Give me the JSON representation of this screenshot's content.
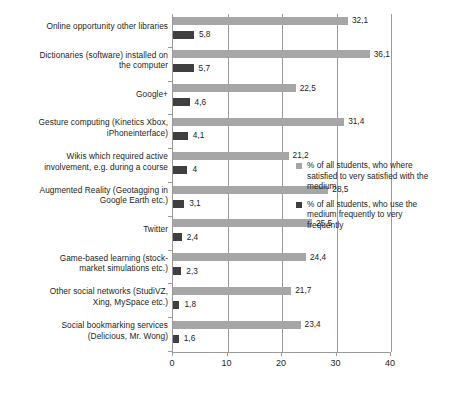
{
  "chart_data": {
    "type": "bar",
    "orientation": "horizontal",
    "title": "",
    "subtitle": "",
    "xlabel": "",
    "ylabel": "",
    "xlim": [
      0,
      40
    ],
    "xticks": [
      "0",
      "10",
      "20",
      "30",
      "40"
    ],
    "grid": true,
    "legend_position": "right",
    "categories": [
      "Online opportunity  other libraries",
      "Dictionaries (software) installed on the computer",
      "Google+",
      "Gesture computing (Kinetics Xbox, iPhoneinterface)",
      "Wikis which required active involvement, e.g. during a course",
      "Augmented Reality (Geotagging in Google Earth etc.)",
      "Twitter",
      "Game-based learning (stock-market simulations etc.)",
      "Other social networks (StudiVZ, Xing, MySpace etc.)",
      "Social bookmarking services (Delicious, Mr. Wong)"
    ],
    "category_lines": [
      [
        "Online opportunity  other libraries"
      ],
      [
        "Dictionaries (software) installed on",
        "the computer"
      ],
      [
        "Google+"
      ],
      [
        "Gesture computing (Kinetics Xbox,",
        "iPhoneinterface)"
      ],
      [
        "Wikis which required active",
        "involvement, e.g. during a course"
      ],
      [
        "Augmented Reality (Geotagging in",
        "Google Earth etc.)"
      ],
      [
        "Twitter"
      ],
      [
        "Game-based learning (stock-",
        "market simulations etc.)"
      ],
      [
        "Other social networks (StudiVZ,",
        "Xing, MySpace etc.)"
      ],
      [
        "Social bookmarking services",
        "(Delicious, Mr. Wong)"
      ]
    ],
    "series": [
      {
        "name": "% of all students, who where satisfied to very satisfied with the medium",
        "color": "#a6a6a6",
        "values": [
          32.1,
          36.1,
          22.5,
          31.4,
          21.2,
          28.5,
          25.5,
          24.4,
          21.7,
          23.4
        ],
        "labels": [
          "32,1",
          "36,1",
          "22,5",
          "31,4",
          "21,2",
          "28,5",
          "25,5",
          "24,4",
          "21,7",
          "23,4"
        ]
      },
      {
        "name": "% of all students, who use the medium frequently to very frequently",
        "color": "#3f3f3f",
        "values": [
          5.8,
          5.7,
          4.6,
          4.1,
          4.0,
          3.1,
          2.4,
          2.3,
          1.8,
          1.6
        ],
        "labels": [
          "5,8",
          "5,7",
          "4,6",
          "4,1",
          "4",
          "3,1",
          "2,4",
          "2,3",
          "1,8",
          "1,6"
        ]
      }
    ]
  },
  "legend": {
    "items": [
      {
        "label_lines": [
          "% of all students, who where",
          "satisfied to very satisfied with the",
          "medium"
        ],
        "color": "#a6a6a6"
      },
      {
        "label_lines": [
          "% of all students, who use the",
          "medium frequently to very",
          "frequently"
        ],
        "color": "#3f3f3f"
      }
    ]
  }
}
